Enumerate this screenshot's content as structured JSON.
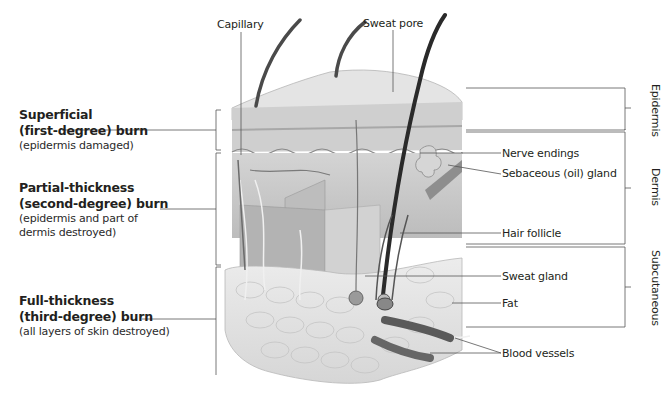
{
  "figure": {
    "burns": [
      {
        "title_line1": "Superficial",
        "title_line2": "(first-degree) burn",
        "desc_line1": "(epidermis damaged)",
        "desc_line2": ""
      },
      {
        "title_line1": "Partial-thickness",
        "title_line2": "(second-degree) burn",
        "desc_line1": "(epidermis and part of",
        "desc_line2": "dermis destroyed)"
      },
      {
        "title_line1": "Full-thickness",
        "title_line2": "(third-degree) burn",
        "desc_line1": "(all layers of skin destroyed)",
        "desc_line2": ""
      }
    ],
    "top_labels": {
      "capillary": "Capillary",
      "sweat_pore": "Sweat pore"
    },
    "right_labels": {
      "nerve_endings": "Nerve endings",
      "sebaceous_gland": "Sebaceous (oil) gland",
      "hair_follicle": "Hair follicle",
      "sweat_gland": "Sweat gland",
      "fat": "Fat",
      "blood_vessels": "Blood vessels"
    },
    "layers": {
      "epidermis": "Epidermis",
      "dermis": "Dermis",
      "subcutaneous": "Subcutaneous"
    },
    "colors": {
      "line": "#555555",
      "skin_light": "#e6e6e6",
      "skin_mid": "#c8c8c8",
      "skin_dark": "#9a9a9a",
      "hair": "#3a3a3a",
      "vessel": "#6e6e6e"
    }
  }
}
